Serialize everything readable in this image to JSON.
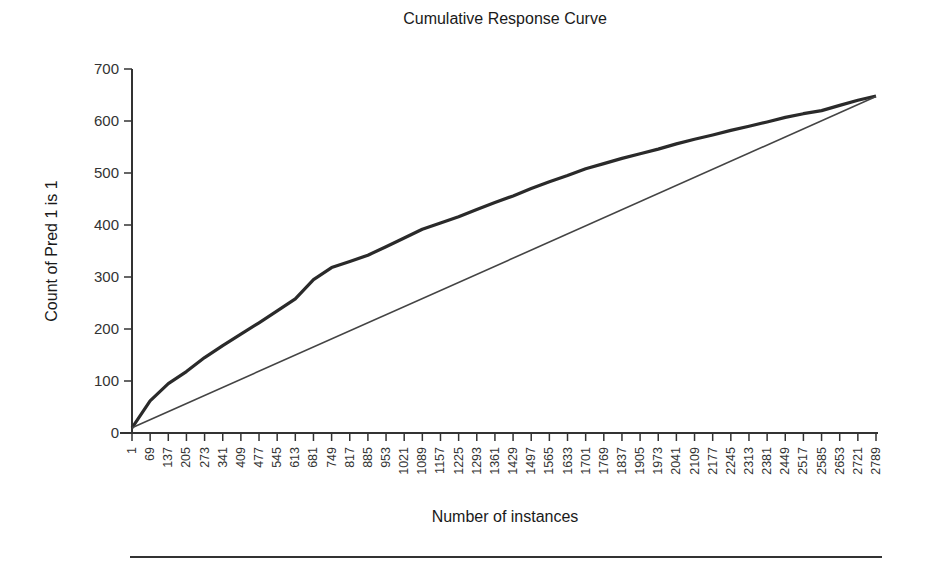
{
  "chart_data": {
    "type": "line",
    "title": "Cumulative Response Curve",
    "xlabel": "Number of instances",
    "ylabel": "Count of Pred 1 is 1",
    "ylim": [
      0,
      700
    ],
    "xlim": [
      1,
      2789
    ],
    "grid": false,
    "legend": null,
    "y_ticks": [
      0,
      100,
      200,
      300,
      400,
      500,
      600,
      700
    ],
    "x_ticks": [
      "1",
      "69",
      "137",
      "205",
      "273",
      "341",
      "409",
      "477",
      "545",
      "613",
      "681",
      "749",
      "817",
      "885",
      "953",
      "1021",
      "1089",
      "1157",
      "1225",
      "1293",
      "1361",
      "1429",
      "1497",
      "1565",
      "1633",
      "1701",
      "1769",
      "1837",
      "1905",
      "1973",
      "2041",
      "2109",
      "2177",
      "2245",
      "2313",
      "2381",
      "2449",
      "2517",
      "2585",
      "2653",
      "2721",
      "2789"
    ],
    "series": [
      {
        "name": "Cumulative response (model)",
        "style": "thick noisy dark line",
        "x": [
          1,
          69,
          137,
          205,
          273,
          341,
          409,
          477,
          545,
          613,
          681,
          749,
          817,
          885,
          953,
          1021,
          1089,
          1157,
          1225,
          1293,
          1361,
          1429,
          1497,
          1565,
          1633,
          1701,
          1769,
          1837,
          1905,
          1973,
          2041,
          2109,
          2177,
          2245,
          2313,
          2381,
          2449,
          2517,
          2585,
          2653,
          2721,
          2789
        ],
        "values": [
          10,
          62,
          95,
          118,
          145,
          168,
          190,
          212,
          235,
          258,
          295,
          318,
          330,
          342,
          358,
          375,
          392,
          404,
          416,
          430,
          443,
          456,
          470,
          483,
          495,
          508,
          518,
          528,
          537,
          546,
          556,
          565,
          573,
          582,
          590,
          598,
          607,
          614,
          620,
          630,
          640,
          648
        ]
      },
      {
        "name": "Baseline (random)",
        "style": "thin straight line",
        "x": [
          1,
          2789
        ],
        "values": [
          10,
          647
        ]
      }
    ]
  }
}
